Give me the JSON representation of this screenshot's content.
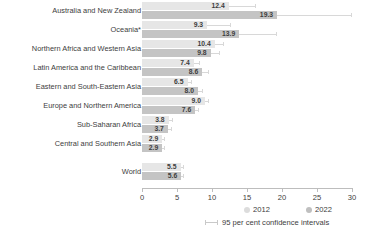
{
  "chart_data": {
    "type": "bar",
    "orientation": "horizontal",
    "title": "",
    "subtitle": "",
    "xlabel": "",
    "ylabel": "",
    "xlim": [
      0,
      30
    ],
    "xticks": [
      0,
      5,
      10,
      15,
      20,
      25,
      30
    ],
    "xtick_labels": [
      "0",
      "5",
      "10",
      "15",
      "20",
      "25",
      "30"
    ],
    "grid": false,
    "legend_position": "bottom-right",
    "categories": [
      "Australia and New Zealand",
      "Oceania*",
      "Northern Africa and Western Asia",
      "Latin America and the Caribbean",
      "Eastern and South-Eastern Asia",
      "Europe and Northern America",
      "Sub-Saharan Africa",
      "Central and Southern Asia",
      "World"
    ],
    "series": [
      {
        "name": "2012",
        "color": "#e6e6e6",
        "values": [
          12.4,
          9.3,
          10.4,
          7.4,
          6.5,
          9.0,
          3.8,
          2.9,
          5.5
        ],
        "ci_low": [
          11.0,
          6.6,
          9.6,
          6.9,
          6.2,
          8.7,
          3.4,
          2.7,
          5.3
        ],
        "ci_high": [
          16.2,
          12.6,
          11.6,
          8.1,
          7.0,
          9.4,
          4.3,
          3.2,
          5.8
        ]
      },
      {
        "name": "2022",
        "color": "#c4c4c4",
        "values": [
          19.3,
          13.9,
          9.8,
          8.6,
          8.0,
          7.6,
          3.7,
          2.9,
          5.6
        ],
        "ci_low": [
          17.2,
          10.7,
          9.0,
          8.1,
          7.6,
          7.3,
          3.3,
          2.7,
          5.4
        ],
        "ci_high": [
          29.8,
          19.2,
          11.0,
          9.4,
          8.6,
          8.0,
          4.1,
          3.2,
          5.9
        ]
      }
    ],
    "value_labels": [
      {
        "category": "Australia and New Zealand",
        "2012": "12.4",
        "2022": "19.3"
      },
      {
        "category": "Oceania*",
        "2012": "9.3",
        "2022": "13.9"
      },
      {
        "category": "Northern Africa and Western Asia",
        "2012": "10.4",
        "2022": "9.8"
      },
      {
        "category": "Latin America and the Caribbean",
        "2012": "7.4",
        "2022": "8.6"
      },
      {
        "category": "Eastern and South-Eastern Asia",
        "2012": "6.5",
        "2022": "8.0"
      },
      {
        "category": "Europe and Northern America",
        "2012": "9.0",
        "2022": "7.6"
      },
      {
        "category": "Sub-Saharan Africa",
        "2012": "3.8",
        "2022": "3.7"
      },
      {
        "category": "Central and Southern Asia",
        "2012": "2.9",
        "2022": "2.9"
      },
      {
        "category": "World",
        "2012": "5.5",
        "2022": "5.6"
      }
    ],
    "annotations": [
      "95 per cent confidence intervals"
    ]
  },
  "legend": {
    "series_2012": "2012",
    "series_2022": "2022",
    "ci_label": "95 per cent confidence intervals"
  }
}
